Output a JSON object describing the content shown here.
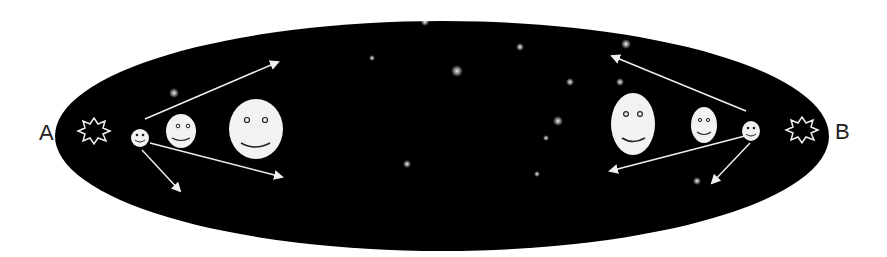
{
  "diagram": {
    "labels": {
      "left": "A",
      "right": "B"
    },
    "colors": {
      "sky": "#000000",
      "figure": "#f2f2f2",
      "ink": "#222222",
      "background": "#ffffff"
    },
    "left_side": {
      "explosion": "starburst-icon",
      "observers": [
        "small",
        "medium",
        "large"
      ],
      "arrows": 3
    },
    "right_side": {
      "explosion": "starburst-icon",
      "observers": [
        "small",
        "medium",
        "large"
      ],
      "arrows": 3
    }
  }
}
